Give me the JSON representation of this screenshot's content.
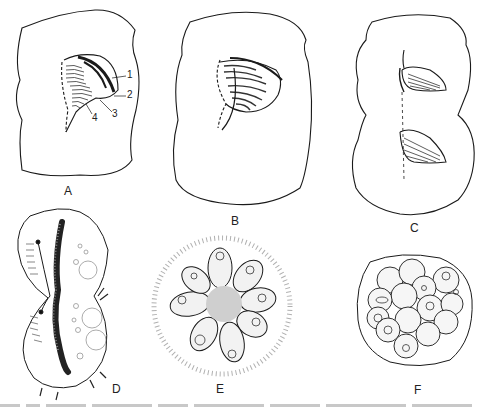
{
  "figure": {
    "panels": [
      {
        "id": "A",
        "label": "A",
        "description": "cell outline with oral apparatus, numbered structures"
      },
      {
        "id": "B",
        "label": "B",
        "description": "cell outline with developing oral apparatus"
      },
      {
        "id": "C",
        "label": "C",
        "description": "dividing cell with two oral apparatuses"
      },
      {
        "id": "D",
        "label": "D",
        "description": "dividing ciliate with elongate macronucleus and vacuoles"
      },
      {
        "id": "E",
        "label": "E",
        "description": "rosette of cells within gelatinous halo"
      },
      {
        "id": "F",
        "label": "F",
        "description": "cyst containing cluster of rounded cells"
      }
    ],
    "annotations": {
      "n1": "1",
      "n2": "2",
      "n3": "3",
      "n4": "4"
    },
    "colors": {
      "line": "#1a1a1a",
      "shade": "#555555",
      "stipple": "#9a9a9a",
      "background": "#ffffff"
    }
  }
}
